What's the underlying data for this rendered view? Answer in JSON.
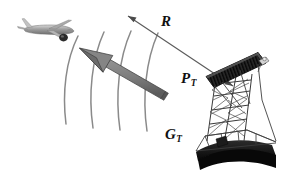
{
  "figure": {
    "name": "radar-transmit-power-diagram",
    "background": "#ffffff",
    "width": 288,
    "height": 173
  },
  "labels": {
    "range": {
      "symbol": "R",
      "subscript": ""
    },
    "transmit_power": {
      "symbol": "P",
      "subscript": "T"
    },
    "transmit_gain": {
      "symbol": "G",
      "subscript": "T"
    }
  },
  "objects": {
    "aircraft": {
      "name": "airliner-target",
      "tone": "#9a9a9a"
    },
    "radar": {
      "name": "radar-antenna-truss",
      "tone": "#2a2a2a"
    },
    "beam_arrow": {
      "name": "transmit-beam-arrow",
      "tone": "#7d7d7d"
    },
    "wavefronts": {
      "name": "radiated-wavefront-arcs",
      "count": 4,
      "tone": "#8c8c8c"
    },
    "range_line": {
      "name": "range-double-arrow",
      "tone": "#5a5a5a"
    }
  },
  "colors": {
    "ink": "#101010",
    "arrow_face": "#7d7d7d",
    "arrow_shade": "#5e5e5e",
    "arc": "#8a8a8a",
    "plane_body": "#a2a2a2",
    "plane_dark": "#3a3a3a",
    "truss": "#3c3c3c",
    "panel_dark": "#232323",
    "base_dark": "#101010"
  }
}
